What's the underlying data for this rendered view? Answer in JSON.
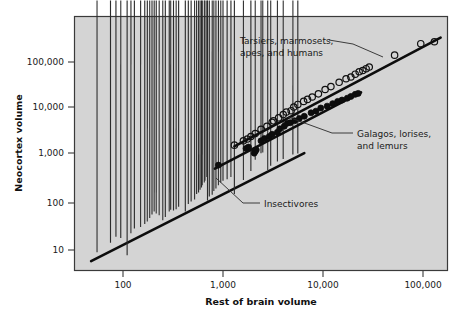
{
  "figure": {
    "background_color": "#ffffff",
    "plot_background_color": "#d4d4d4",
    "frame_color": "#3a3a3a"
  },
  "chart_data": {
    "type": "scatter",
    "title": "",
    "xlabel": "Rest of brain volume",
    "ylabel": "Neocortex volume",
    "xscale": "log",
    "yscale": "log",
    "xlim": [
      45,
      200000
    ],
    "ylim": [
      5,
      400000
    ],
    "grid": false,
    "legend_position": "inline-annotations",
    "xticks": [
      100,
      1000,
      10000,
      100000
    ],
    "xtick_labels": [
      "100",
      "1,000",
      "10,000",
      "100,000"
    ],
    "yticks": [
      10,
      100,
      1000,
      10000,
      100000
    ],
    "ytick_labels": [
      "10",
      "100",
      "1,000",
      "10,000",
      "100,000"
    ],
    "series": [
      {
        "name": "Tarsiers, marmosets, apes, and humans",
        "marker": "open-circle",
        "marker_color": "#111111",
        "annotation": "Tarsiers, marmosets,\napes, and humans",
        "points": [
          [
            1300,
            1700
          ],
          [
            1600,
            2100
          ],
          [
            1750,
            2300
          ],
          [
            1900,
            2600
          ],
          [
            2100,
            3000
          ],
          [
            2400,
            3700
          ],
          [
            2750,
            4300
          ],
          [
            3100,
            5200
          ],
          [
            3200,
            5600
          ],
          [
            3600,
            6500
          ],
          [
            4000,
            7600
          ],
          [
            4300,
            8600
          ],
          [
            4800,
            9200
          ],
          [
            5100,
            11000
          ],
          [
            5600,
            12500
          ],
          [
            6400,
            14500
          ],
          [
            7000,
            16000
          ],
          [
            7800,
            18000
          ],
          [
            9000,
            21000
          ],
          [
            10500,
            26000
          ],
          [
            12000,
            30000
          ],
          [
            14500,
            37000
          ],
          [
            17000,
            44000
          ],
          [
            19000,
            48000
          ],
          [
            21000,
            55000
          ],
          [
            23000,
            62000
          ],
          [
            25000,
            66000
          ],
          [
            27000,
            72000
          ],
          [
            29000,
            78000
          ],
          [
            52000,
            140000
          ],
          [
            95000,
            245000
          ],
          [
            130000,
            270000
          ]
        ],
        "trendline": {
          "x0": 1300,
          "y0": 1600,
          "x1": 150000,
          "y1": 330000
        }
      },
      {
        "name": "Galagos, lorises, and lemurs",
        "marker": "filled-circle",
        "marker_color": "#0d0d0d",
        "annotation": "Galagos, lorises,\nand lemurs",
        "points": [
          [
            900,
            640
          ],
          [
            1700,
            1450
          ],
          [
            1800,
            1550
          ],
          [
            2050,
            1150
          ],
          [
            2100,
            1250
          ],
          [
            2150,
            1350
          ],
          [
            2400,
            2100
          ],
          [
            2600,
            2350
          ],
          [
            2900,
            2600
          ],
          [
            3100,
            2900
          ],
          [
            3500,
            3200
          ],
          [
            3700,
            3800
          ],
          [
            4100,
            4300
          ],
          [
            4400,
            5000
          ],
          [
            4700,
            5100
          ],
          [
            5200,
            5600
          ],
          [
            5800,
            6300
          ],
          [
            6500,
            7000
          ],
          [
            7600,
            8300
          ],
          [
            8500,
            9000
          ],
          [
            9500,
            10500
          ],
          [
            11000,
            11500
          ],
          [
            12500,
            13000
          ],
          [
            14000,
            14500
          ],
          [
            15500,
            15500
          ],
          [
            17500,
            17000
          ],
          [
            19000,
            18500
          ],
          [
            21000,
            20500
          ],
          [
            22500,
            21500
          ]
        ],
        "trendline": {
          "x0": 830,
          "y0": 540,
          "x1": 24000,
          "y1": 22500
        }
      },
      {
        "name": "Insectivores",
        "marker": "open-diamond",
        "marker_color": "#2b2b2b",
        "annotation": "Insectivores",
        "points": [
          [
            55,
            7.5
          ],
          [
            75,
            12
          ],
          [
            85,
            16
          ],
          [
            95,
            15
          ],
          [
            110,
            6.5
          ],
          [
            120,
            19
          ],
          [
            130,
            24
          ],
          [
            150,
            26
          ],
          [
            165,
            30
          ],
          [
            175,
            34
          ],
          [
            185,
            40
          ],
          [
            195,
            48
          ],
          [
            205,
            55
          ],
          [
            215,
            50
          ],
          [
            230,
            46
          ],
          [
            250,
            36
          ],
          [
            265,
            42
          ],
          [
            290,
            55
          ],
          [
            300,
            60
          ],
          [
            320,
            58
          ],
          [
            340,
            62
          ],
          [
            360,
            70
          ],
          [
            420,
            55
          ],
          [
            450,
            80
          ],
          [
            480,
            90
          ],
          [
            520,
            100
          ],
          [
            545,
            130
          ],
          [
            570,
            140
          ],
          [
            590,
            160
          ],
          [
            610,
            180
          ],
          [
            620,
            200
          ],
          [
            650,
            230
          ],
          [
            660,
            250
          ],
          [
            690,
            300
          ],
          [
            700,
            95
          ],
          [
            730,
            115
          ],
          [
            780,
            125
          ],
          [
            810,
            150
          ],
          [
            850,
            170
          ],
          [
            900,
            200
          ],
          [
            950,
            230
          ],
          [
            1000,
            250
          ],
          [
            1100,
            270
          ],
          [
            1200,
            300
          ],
          [
            1300,
            130
          ],
          [
            1600,
            260
          ],
          [
            1900,
            400
          ],
          [
            2100,
            700
          ],
          [
            2400,
            960
          ],
          [
            2500,
            1000
          ],
          [
            2800,
            420
          ],
          [
            3000,
            520
          ],
          [
            3500,
            640
          ],
          [
            4000,
            720
          ],
          [
            5000,
            900
          ],
          [
            5600,
            950
          ]
        ],
        "trendline": {
          "x0": 48,
          "y0": 5.8,
          "x1": 6500,
          "y1": 1150
        }
      }
    ]
  },
  "annotations": [
    {
      "name": "annotation-primates",
      "line1": "Tarsiers, marmosets,",
      "line2": "apes, and humans"
    },
    {
      "name": "annotation-strepsirrhines",
      "line1": "Galagos, lorises,",
      "line2": "and lemurs"
    },
    {
      "name": "annotation-insectivores",
      "line1": "Insectivores",
      "line2": ""
    }
  ],
  "axes": {
    "x_title": "Rest of brain volume",
    "y_title": "Neocortex volume",
    "x_labels": [
      "100",
      "1,000",
      "10,000",
      "100,000"
    ],
    "y_labels": [
      "100,000",
      "10,000",
      "1,000",
      "100",
      "10"
    ]
  }
}
